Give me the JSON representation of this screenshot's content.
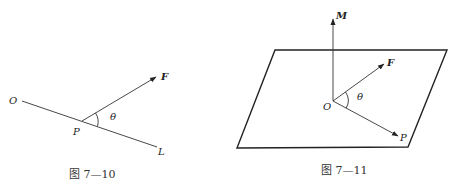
{
  "figures": [
    {
      "id": "fig-7-10",
      "caption": "图 7—10",
      "labels": {
        "line_start": "O",
        "vertex": "P",
        "line_end": "L",
        "vector": "F",
        "angle": "θ"
      }
    },
    {
      "id": "fig-7-11",
      "caption": "图 7—11",
      "labels": {
        "normal": "M",
        "vector_f": "F",
        "origin": "O",
        "angle": "θ",
        "vector_p": "P"
      }
    }
  ],
  "colors": {
    "stroke": "#333333",
    "background": "#ffffff"
  }
}
